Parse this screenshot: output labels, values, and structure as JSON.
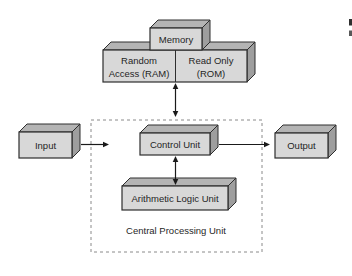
{
  "figure": {
    "cpu_container_label": "Central Processing Unit",
    "boxes": {
      "memory": {
        "label": "Memory"
      },
      "ram": {
        "lines": [
          "Random",
          "Access (RAM)"
        ]
      },
      "rom": {
        "lines": [
          "Read Only",
          "(ROM)"
        ]
      },
      "input": {
        "label": "Input"
      },
      "output": {
        "label": "Output"
      },
      "control_unit": {
        "label": "Control Unit"
      },
      "alu": {
        "label": "Arithmetic Logic Unit"
      }
    },
    "connections": [
      {
        "from": "input",
        "to": "central-processing-unit",
        "style": "single-arrow-right"
      },
      {
        "from": "control-unit",
        "to": "output",
        "style": "single-arrow-right"
      },
      {
        "from": "memory",
        "to": "central-processing-unit",
        "style": "double-arrow-vertical"
      },
      {
        "from": "control-unit",
        "to": "arithmetic-logic-unit",
        "style": "double-arrow-vertical"
      }
    ],
    "colors": {
      "background": "#ffffff",
      "box_front": "#d8d8d8",
      "box_top": "#b4b4b4",
      "box_side": "#9e9e9e",
      "outline": "#2e2e2e",
      "dashed_border": "#8a8a8a",
      "arrow": "#1a1a1a",
      "text": "#1f1f1f",
      "fragment_dark": "#2f2f2f",
      "fragment_light": "#585858"
    }
  }
}
